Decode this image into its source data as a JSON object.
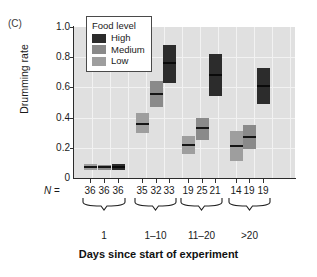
{
  "panel": {
    "label": "(C)"
  },
  "legend": {
    "title": "Food level",
    "items": [
      {
        "label": "High",
        "color": "#2c2c2c"
      },
      {
        "label": "Medium",
        "color": "#8a8a8a"
      },
      {
        "label": "Low",
        "color": "#9e9e9e"
      }
    ]
  },
  "axes": {
    "ylabel": "Drumming rate",
    "xlabel": "Days since start of experiment",
    "yticks": [
      "1.0",
      "0.8",
      "0.6",
      "0.4",
      "0.2",
      "0"
    ],
    "n_prefix": "N",
    "n_equals": " ="
  },
  "chart_data": {
    "type": "box",
    "title": "",
    "xlabel": "Days since start of experiment",
    "ylabel": "Drumming rate",
    "ylim": [
      0,
      1.0
    ],
    "yticks": [
      0,
      0.2,
      0.4,
      0.6,
      0.8,
      1.0
    ],
    "grid": true,
    "legend_position": "top-left-inside",
    "legend_title": "Food level",
    "categories": [
      "1",
      "1–10",
      "11–20",
      ">20"
    ],
    "series": [
      {
        "name": "Low",
        "color": "#9e9e9e",
        "n": [
          36,
          35,
          19,
          14
        ],
        "boxes": [
          {
            "low": 0.05,
            "median": 0.07,
            "high": 0.09
          },
          {
            "low": 0.3,
            "median": 0.36,
            "high": 0.43
          },
          {
            "low": 0.16,
            "median": 0.22,
            "high": 0.28
          },
          {
            "low": 0.11,
            "median": 0.21,
            "high": 0.31
          }
        ]
      },
      {
        "name": "Medium",
        "color": "#8a8a8a",
        "n": [
          36,
          32,
          25,
          19
        ],
        "boxes": [
          {
            "low": 0.055,
            "median": 0.07,
            "high": 0.085
          },
          {
            "low": 0.47,
            "median": 0.555,
            "high": 0.64
          },
          {
            "low": 0.25,
            "median": 0.33,
            "high": 0.4
          },
          {
            "low": 0.19,
            "median": 0.27,
            "high": 0.35
          }
        ]
      },
      {
        "name": "High",
        "color": "#2c2c2c",
        "n": [
          36,
          33,
          21,
          19
        ],
        "boxes": [
          {
            "low": 0.055,
            "median": 0.072,
            "high": 0.09
          },
          {
            "low": 0.63,
            "median": 0.76,
            "high": 0.88
          },
          {
            "low": 0.54,
            "median": 0.68,
            "high": 0.82
          },
          {
            "low": 0.49,
            "median": 0.61,
            "high": 0.73
          }
        ]
      }
    ],
    "n_row_label": "N =",
    "n_values": [
      [
        36,
        36,
        36
      ],
      [
        35,
        32,
        33
      ],
      [
        19,
        25,
        21
      ],
      [
        14,
        19,
        19
      ]
    ]
  }
}
